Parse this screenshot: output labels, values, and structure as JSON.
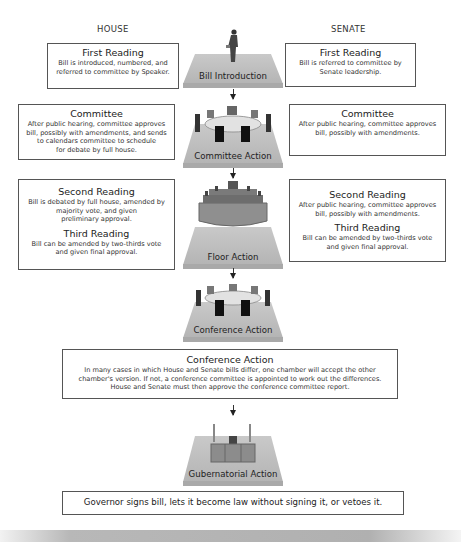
{
  "columns": {
    "house": "HOUSE",
    "senate": "SENATE"
  },
  "house": {
    "first_reading": {
      "title": "First Reading",
      "lines": [
        "Bill is introduced, numbered, and",
        "referred to committee by Speaker."
      ]
    },
    "committee": {
      "title": "Committee",
      "lines": [
        "After public hearing, committee approves",
        "bill, possibly with amendments, and sends",
        "to calendars committee to schedule",
        "for debate by full house."
      ]
    },
    "second_reading": {
      "title": "Second Reading",
      "lines": [
        "Bill is debated by full house, amended by",
        "majority vote, and given",
        "preliminary approval."
      ]
    },
    "third_reading": {
      "title": "Third Reading",
      "lines": [
        "Bill can be amended by two-thirds vote",
        "and given final approval."
      ]
    }
  },
  "senate": {
    "first_reading": {
      "title": "First Reading",
      "lines": [
        "Bill is referred to committee by",
        "Senate leadership."
      ]
    },
    "committee": {
      "title": "Committee",
      "lines": [
        "After public hearing, committee approves",
        "bill, possibly with amendments."
      ]
    },
    "second_reading": {
      "title": "Second Reading",
      "lines": [
        "After public hearing, committee approves",
        "bill, possibly with amendments."
      ]
    },
    "third_reading": {
      "title": "Third Reading",
      "lines": [
        "Bill can be amended by two-thirds vote",
        "and given final approval."
      ]
    }
  },
  "stages": [
    {
      "label": "Bill Introduction",
      "icon": "person-icon"
    },
    {
      "label": "Committee Action",
      "icon": "committee-table-icon"
    },
    {
      "label": "Floor Action",
      "icon": "chamber-icon"
    },
    {
      "label": "Conference Action",
      "icon": "conference-table-icon"
    },
    {
      "label": "Gubernatorial Action",
      "icon": "governor-desk-icon"
    }
  ],
  "conference": {
    "title": "Conference Action",
    "lines": [
      "In many cases in which House and Senate bills differ, one chamber will accept the other",
      "chamber's version. If not, a conference committee is appointed to work out the differences.",
      "House and Senate must then approve the conference committee report."
    ]
  },
  "governor": {
    "text": "Governor signs bill, lets it become law without signing it, or vetoes it."
  }
}
